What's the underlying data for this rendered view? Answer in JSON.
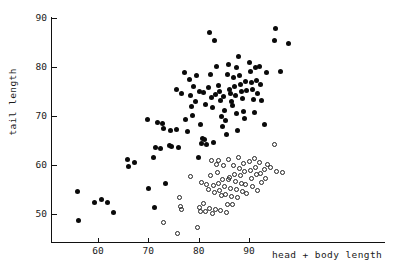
{
  "chart_data": {
    "type": "scatter",
    "title": "",
    "xlabel": "head + body length",
    "ylabel": "tail length",
    "xlim": [
      52,
      99
    ],
    "ylim": [
      45.5,
      90.5
    ],
    "xticks": [
      60,
      70,
      80,
      90
    ],
    "xtick_labels": [
      "60",
      "70",
      "80",
      "90"
    ],
    "yticks": [
      50,
      60,
      70,
      80,
      90
    ],
    "ytick_labels": [
      "50",
      "60",
      "70",
      "80",
      "90"
    ],
    "grid": false,
    "legend": "none",
    "series": [
      {
        "name": "filled-group",
        "marker": "filled-circle",
        "color": "#0a0a0a",
        "points": [
          [
            56.0,
            54.5
          ],
          [
            56.2,
            48.6
          ],
          [
            59.4,
            52.3
          ],
          [
            60.6,
            52.9
          ],
          [
            61.8,
            52.4
          ],
          [
            63.0,
            50.4
          ],
          [
            65.9,
            61.2
          ],
          [
            66.0,
            59.7
          ],
          [
            67.3,
            60.5
          ],
          [
            69.8,
            69.3
          ],
          [
            70.0,
            55.2
          ],
          [
            71.0,
            61.6
          ],
          [
            71.2,
            51.4
          ],
          [
            71.5,
            63.5
          ],
          [
            71.8,
            68.7
          ],
          [
            72.4,
            63.3
          ],
          [
            72.8,
            68.5
          ],
          [
            73.1,
            67.4
          ],
          [
            73.4,
            56.3
          ],
          [
            74.2,
            64.0
          ],
          [
            74.4,
            67.0
          ],
          [
            74.6,
            63.8
          ],
          [
            75.5,
            67.2
          ],
          [
            75.6,
            75.5
          ],
          [
            76.0,
            63.5
          ],
          [
            76.6,
            74.5
          ],
          [
            77.2,
            78.8
          ],
          [
            77.4,
            69.2
          ],
          [
            77.8,
            66.8
          ],
          [
            78.2,
            77.4
          ],
          [
            78.4,
            74.2
          ],
          [
            78.6,
            72.0
          ],
          [
            78.8,
            70.2
          ],
          [
            79.4,
            73.0
          ],
          [
            79.6,
            78.2
          ],
          [
            80.0,
            61.5
          ],
          [
            80.2,
            75.0
          ],
          [
            80.4,
            68.2
          ],
          [
            80.6,
            64.4
          ],
          [
            80.8,
            65.5
          ],
          [
            81.0,
            74.8
          ],
          [
            81.2,
            65.3
          ],
          [
            81.4,
            72.3
          ],
          [
            81.6,
            64.2
          ],
          [
            82.0,
            75.8
          ],
          [
            82.2,
            87.0
          ],
          [
            82.4,
            78.5
          ],
          [
            82.6,
            73.8
          ],
          [
            82.8,
            71.8
          ],
          [
            83.0,
            64.6
          ],
          [
            83.2,
            85.5
          ],
          [
            83.4,
            74.4
          ],
          [
            83.6,
            80.2
          ],
          [
            84.0,
            76.2
          ],
          [
            84.2,
            75.0
          ],
          [
            84.4,
            73.2
          ],
          [
            84.6,
            70.0
          ],
          [
            84.8,
            67.8
          ],
          [
            85.0,
            74.0
          ],
          [
            85.2,
            71.2
          ],
          [
            85.4,
            69.0
          ],
          [
            85.6,
            66.2
          ],
          [
            86.0,
            80.5
          ],
          [
            86.2,
            75.5
          ],
          [
            86.4,
            74.6
          ],
          [
            86.6,
            73.0
          ],
          [
            86.8,
            72.2
          ],
          [
            87.0,
            77.8
          ],
          [
            87.2,
            76.0
          ],
          [
            87.4,
            74.2
          ],
          [
            87.6,
            70.5
          ],
          [
            87.8,
            67.0
          ],
          [
            88.0,
            82.2
          ],
          [
            88.2,
            78.2
          ],
          [
            88.4,
            76.4
          ],
          [
            88.6,
            75.0
          ],
          [
            88.8,
            73.6
          ],
          [
            89.0,
            71.0
          ],
          [
            89.2,
            69.5
          ],
          [
            89.4,
            77.0
          ],
          [
            89.6,
            75.2
          ],
          [
            90.0,
            81.0
          ],
          [
            90.2,
            79.0
          ],
          [
            90.4,
            76.8
          ],
          [
            90.6,
            75.4
          ],
          [
            90.8,
            73.4
          ],
          [
            91.0,
            70.8
          ],
          [
            91.2,
            79.8
          ],
          [
            91.4,
            77.2
          ],
          [
            91.6,
            74.6
          ],
          [
            92.0,
            80.2
          ],
          [
            92.2,
            76.4
          ],
          [
            92.4,
            73.2
          ],
          [
            93.0,
            68.3
          ],
          [
            93.4,
            78.8
          ],
          [
            95.0,
            85.5
          ],
          [
            95.2,
            87.8
          ],
          [
            96.2,
            79.0
          ],
          [
            97.8,
            84.7
          ],
          [
            79.0,
            76.0
          ],
          [
            85.8,
            78.4
          ],
          [
            87.5,
            80.0
          ]
        ]
      },
      {
        "name": "open-group",
        "marker": "open-circle",
        "color": "#222222",
        "points": [
          [
            73.0,
            48.2
          ],
          [
            75.8,
            46.0
          ],
          [
            76.2,
            53.4
          ],
          [
            76.4,
            51.6
          ],
          [
            76.6,
            51.0
          ],
          [
            78.4,
            57.6
          ],
          [
            79.8,
            47.2
          ],
          [
            80.2,
            51.4
          ],
          [
            80.4,
            50.6
          ],
          [
            80.6,
            56.4
          ],
          [
            81.0,
            52.2
          ],
          [
            81.4,
            50.6
          ],
          [
            81.6,
            56.0
          ],
          [
            82.0,
            55.0
          ],
          [
            82.2,
            51.2
          ],
          [
            82.4,
            57.8
          ],
          [
            82.6,
            61.0
          ],
          [
            82.8,
            50.2
          ],
          [
            83.0,
            55.8
          ],
          [
            83.2,
            54.4
          ],
          [
            83.4,
            51.0
          ],
          [
            83.6,
            60.2
          ],
          [
            83.8,
            58.4
          ],
          [
            84.0,
            56.2
          ],
          [
            84.2,
            54.8
          ],
          [
            84.4,
            50.8
          ],
          [
            84.6,
            53.8
          ],
          [
            84.8,
            57.0
          ],
          [
            85.0,
            59.8
          ],
          [
            85.2,
            55.6
          ],
          [
            85.4,
            54.0
          ],
          [
            85.6,
            50.4
          ],
          [
            86.0,
            61.2
          ],
          [
            86.2,
            57.4
          ],
          [
            86.4,
            55.2
          ],
          [
            86.6,
            53.6
          ],
          [
            86.8,
            52.0
          ],
          [
            87.0,
            60.0
          ],
          [
            87.2,
            58.0
          ],
          [
            87.4,
            56.6
          ],
          [
            87.6,
            55.0
          ],
          [
            87.8,
            53.4
          ],
          [
            88.0,
            61.5
          ],
          [
            88.2,
            59.2
          ],
          [
            88.4,
            57.8
          ],
          [
            88.6,
            56.2
          ],
          [
            88.8,
            54.6
          ],
          [
            89.0,
            60.4
          ],
          [
            89.2,
            58.6
          ],
          [
            89.4,
            56.0
          ],
          [
            89.6,
            54.2
          ],
          [
            90.0,
            60.8
          ],
          [
            90.2,
            58.8
          ],
          [
            90.4,
            57.2
          ],
          [
            90.6,
            55.6
          ],
          [
            91.0,
            61.4
          ],
          [
            91.2,
            59.4
          ],
          [
            91.4,
            58.0
          ],
          [
            91.6,
            54.8
          ],
          [
            92.0,
            60.6
          ],
          [
            92.2,
            58.2
          ],
          [
            92.4,
            56.4
          ],
          [
            93.0,
            59.0
          ],
          [
            93.2,
            57.2
          ],
          [
            93.6,
            60.2
          ],
          [
            94.2,
            59.4
          ],
          [
            95.0,
            64.2
          ],
          [
            95.4,
            58.6
          ],
          [
            96.6,
            58.4
          ],
          [
            86.0,
            57.0
          ],
          [
            85.8,
            52.0
          ],
          [
            84.0,
            61.0
          ]
        ]
      }
    ]
  },
  "axes": {
    "x_title": "head + body length",
    "y_title": "tail length"
  }
}
